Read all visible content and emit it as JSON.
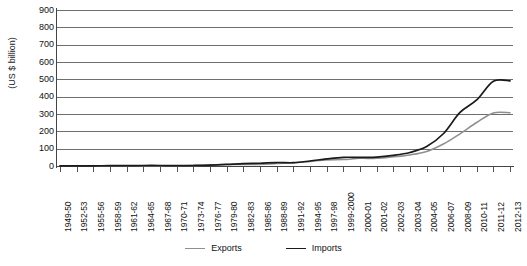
{
  "chart_data": {
    "type": "line",
    "title": "",
    "xlabel": "",
    "ylabel": "(US $ billion)",
    "ylim": [
      0,
      900
    ],
    "ytick_step": 100,
    "yticks": [
      900,
      800,
      700,
      600,
      500,
      400,
      300,
      200,
      100,
      0
    ],
    "grid": true,
    "legend_position": "bottom",
    "categories": [
      "1949-50",
      "1952-53",
      "1955-56",
      "1958-59",
      "1961-62",
      "1964-65",
      "1967-68",
      "1970-71",
      "1973-74",
      "1976-77",
      "1979-80",
      "1982-83",
      "1985-86",
      "1988-89",
      "1991-92",
      "1994-95",
      "1997-98",
      "1999-2000",
      "2000-01",
      "2001-02",
      "2002-03",
      "2003-04",
      "2004-05",
      "2006-07",
      "2008-09",
      "2010-11",
      "2011-12",
      "2012-13"
    ],
    "series": [
      {
        "name": "Exports",
        "color": "#8f8f8f",
        "values": [
          1,
          1,
          1,
          1,
          1,
          2,
          2,
          2,
          3,
          6,
          8,
          9,
          9,
          14,
          18,
          26,
          35,
          37,
          44,
          44,
          53,
          64,
          84,
          127,
          186,
          251,
          306,
          307
        ]
      },
      {
        "name": "Imports",
        "color": "#1a1a1a",
        "values": [
          1,
          1,
          1,
          2,
          2,
          3,
          3,
          2,
          3,
          5,
          9,
          14,
          16,
          20,
          19,
          29,
          41,
          50,
          50,
          51,
          61,
          78,
          112,
          186,
          309,
          381,
          489,
          491
        ]
      }
    ]
  },
  "legend": {
    "items": [
      {
        "label": "Exports",
        "color": "#8f8f8f"
      },
      {
        "label": "Imports",
        "color": "#1a1a1a"
      }
    ]
  }
}
